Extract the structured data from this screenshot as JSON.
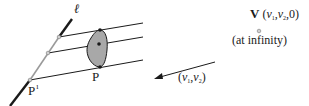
{
  "diagram": {
    "labels": {
      "line": "ℓ",
      "point_prime": "P",
      "point_prime_mark": "ı",
      "point": "P",
      "vanishing_name": "V",
      "vanishing_coords_open": "(",
      "vanishing_v1": "v",
      "vanishing_sub1": "1",
      "vanishing_sep1": ",",
      "vanishing_v2": "v",
      "vanishing_sub2": "2",
      "vanishing_tail": ",0)",
      "at_infinity": "(at infinity)",
      "direction_open": "(",
      "direction_v1": "v",
      "direction_sub1": "1",
      "direction_sep": ",",
      "direction_v2": "v",
      "direction_sub2": "2",
      "direction_close": ")"
    },
    "colors": {
      "ink": "#1a1a1a",
      "gray_segment": "#9a9a9a",
      "region_fill": "#a8a8a8",
      "node_fill": "#d0d0d0"
    }
  }
}
